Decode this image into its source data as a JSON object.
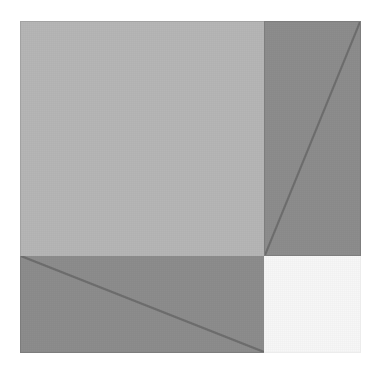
{
  "image": {
    "title": "Abstract geometric grid composition",
    "background_color": "#ffffff",
    "width": 380,
    "height": 376
  },
  "composition": {
    "origin_x": 20,
    "origin_y": 21,
    "width": 341,
    "height": 332,
    "edge_color": "#a2a2a2",
    "split_x": 244,
    "split_y": 235,
    "diagonal_color": "#6e6e6e",
    "diagonal_width": 2
  },
  "panels": [
    {
      "id": "panel-a",
      "label": "Upper left light grey rectangle",
      "position": "top-left",
      "fill": "#b6b6b6",
      "diagonal": "none"
    },
    {
      "id": "panel-b",
      "label": "Upper right mid grey rectangle with rising diagonal",
      "position": "top-right",
      "fill": "#8d8d8d",
      "diagonal": "bottom-left-to-top-right"
    },
    {
      "id": "panel-c",
      "label": "Lower left mid grey rectangle with falling diagonal",
      "position": "bottom-left",
      "fill": "#8d8d8d",
      "diagonal": "top-left-to-bottom-right"
    },
    {
      "id": "panel-d",
      "label": "Lower right off white square",
      "position": "bottom-right",
      "fill": "#f7f7f7",
      "diagonal": "none"
    }
  ]
}
